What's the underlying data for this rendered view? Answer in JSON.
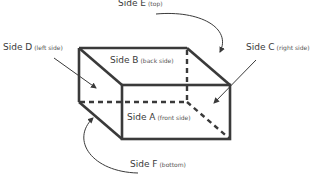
{
  "diagram": {
    "colors": {
      "stroke": "#3a3a3a",
      "text": "#3a3a3a",
      "background": "#ffffff"
    },
    "labels": {
      "side_a": {
        "main": "Side A",
        "sub": "(front side)"
      },
      "side_b": {
        "main": "Side B",
        "sub": "(back side)"
      },
      "side_c": {
        "main": "Side C",
        "sub": "(right side)"
      },
      "side_d": {
        "main": "Side D",
        "sub": "(left side)"
      },
      "side_e": {
        "main": "Side E",
        "sub": "(top)"
      },
      "side_f": {
        "main": "Side F",
        "sub": "(bottom)"
      }
    }
  }
}
